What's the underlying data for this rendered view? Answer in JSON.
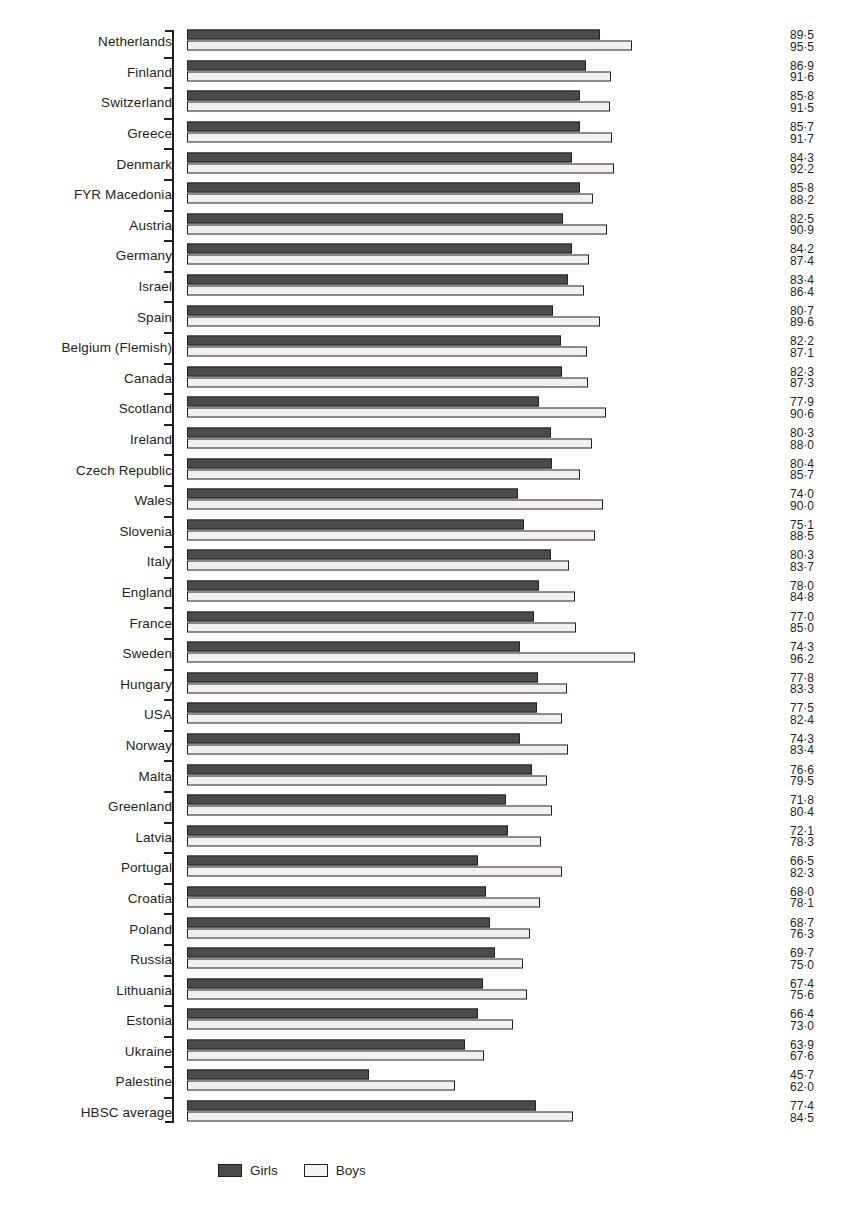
{
  "chart_data": {
    "type": "bar",
    "orientation": "horizontal",
    "title": "",
    "xlabel": "",
    "ylabel": "",
    "grid": false,
    "xlim": [
      0,
      100
    ],
    "value_suffix": "",
    "decimal_separator": "·",
    "legend": {
      "position": "bottom-left",
      "entries": [
        {
          "name": "Girls",
          "color": "#4d4a4b"
        },
        {
          "name": "Boys",
          "color": "#f5f4f2"
        }
      ]
    },
    "series": [
      {
        "name": "Girls",
        "color": "#4d4a4b"
      },
      {
        "name": "Boys",
        "color": "#f5f4f2"
      }
    ],
    "categories": [
      "Netherlands",
      "Finland",
      "Switzerland",
      "Greece",
      "Denmark",
      "FYR Macedonia",
      "Austria",
      "Germany",
      "Israel",
      "Spain",
      "Belgium (Flemish)",
      "Canada",
      "Scotland",
      "Ireland",
      "Czech Republic",
      "Wales",
      "Slovenia",
      "Italy",
      "England",
      "France",
      "Sweden",
      "Hungary",
      "USA",
      "Norway",
      "Malta",
      "Greenland",
      "Latvia",
      "Portugal",
      "Croatia",
      "Poland",
      "Russia",
      "Lithuania",
      "Estonia",
      "Ukraine",
      "Palestine",
      "HBSC average"
    ],
    "rows": [
      {
        "category": "Netherlands",
        "girls": 89.5,
        "boys": 95.5,
        "girls_label": "89·5",
        "boys_label": "95·5"
      },
      {
        "category": "Finland",
        "girls": 86.9,
        "boys": 91.6,
        "girls_label": "86·9",
        "boys_label": "91·6"
      },
      {
        "category": "Switzerland",
        "girls": 85.8,
        "boys": 91.5,
        "girls_label": "85·8",
        "boys_label": "91·5"
      },
      {
        "category": "Greece",
        "girls": 85.7,
        "boys": 91.7,
        "girls_label": "85·7",
        "boys_label": "91·7"
      },
      {
        "category": "Denmark",
        "girls": 84.3,
        "boys": 92.2,
        "girls_label": "84·3",
        "boys_label": "92·2"
      },
      {
        "category": "FYR Macedonia",
        "girls": 85.8,
        "boys": 88.2,
        "girls_label": "85·8",
        "boys_label": "88·2"
      },
      {
        "category": "Austria",
        "girls": 82.5,
        "boys": 90.9,
        "girls_label": "82·5",
        "boys_label": "90·9"
      },
      {
        "category": "Germany",
        "girls": 84.2,
        "boys": 87.4,
        "girls_label": "84·2",
        "boys_label": "87·4"
      },
      {
        "category": "Israel",
        "girls": 83.4,
        "boys": 86.4,
        "girls_label": "83·4",
        "boys_label": "86·4"
      },
      {
        "category": "Spain",
        "girls": 80.7,
        "boys": 89.6,
        "girls_label": "80·7",
        "boys_label": "89·6"
      },
      {
        "category": "Belgium (Flemish)",
        "girls": 82.2,
        "boys": 87.1,
        "girls_label": "82·2",
        "boys_label": "87·1"
      },
      {
        "category": "Canada",
        "girls": 82.3,
        "boys": 87.3,
        "girls_label": "82·3",
        "boys_label": "87·3"
      },
      {
        "category": "Scotland",
        "girls": 77.9,
        "boys": 90.6,
        "girls_label": "77·9",
        "boys_label": "90·6"
      },
      {
        "category": "Ireland",
        "girls": 80.3,
        "boys": 88.0,
        "girls_label": "80·3",
        "boys_label": "88·0"
      },
      {
        "category": "Czech Republic",
        "girls": 80.4,
        "boys": 85.7,
        "girls_label": "80·4",
        "boys_label": "85·7"
      },
      {
        "category": "Wales",
        "girls": 74.0,
        "boys": 90.0,
        "girls_label": "74·0",
        "boys_label": "90·0"
      },
      {
        "category": "Slovenia",
        "girls": 75.1,
        "boys": 88.5,
        "girls_label": "75·1",
        "boys_label": "88·5"
      },
      {
        "category": "Italy",
        "girls": 80.3,
        "boys": 83.7,
        "girls_label": "80·3",
        "boys_label": "83·7"
      },
      {
        "category": "England",
        "girls": 78.0,
        "boys": 84.8,
        "girls_label": "78·0",
        "boys_label": "84·8"
      },
      {
        "category": "France",
        "girls": 77.0,
        "boys": 85.0,
        "girls_label": "77·0",
        "boys_label": "85·0"
      },
      {
        "category": "Sweden",
        "girls": 74.3,
        "boys": 96.2,
        "girls_label": "74·3",
        "boys_label": "96·2"
      },
      {
        "category": "Hungary",
        "girls": 77.8,
        "boys": 83.3,
        "girls_label": "77·8",
        "boys_label": "83·3"
      },
      {
        "category": "USA",
        "girls": 77.5,
        "boys": 82.4,
        "girls_label": "77·5",
        "boys_label": "82·4"
      },
      {
        "category": "Norway",
        "girls": 74.3,
        "boys": 83.4,
        "girls_label": "74·3",
        "boys_label": "83·4"
      },
      {
        "category": "Malta",
        "girls": 76.6,
        "boys": 79.5,
        "girls_label": "76·6",
        "boys_label": "79·5"
      },
      {
        "category": "Greenland",
        "girls": 71.8,
        "boys": 80.4,
        "girls_label": "71·8",
        "boys_label": "80·4"
      },
      {
        "category": "Latvia",
        "girls": 72.1,
        "boys": 78.3,
        "girls_label": "72·1",
        "boys_label": "78·3"
      },
      {
        "category": "Portugal",
        "girls": 66.5,
        "boys": 82.3,
        "girls_label": "66·5",
        "boys_label": "82·3"
      },
      {
        "category": "Croatia",
        "girls": 68.0,
        "boys": 78.1,
        "girls_label": "68·0",
        "boys_label": "78·1"
      },
      {
        "category": "Poland",
        "girls": 68.7,
        "boys": 76.3,
        "girls_label": "68·7",
        "boys_label": "76·3"
      },
      {
        "category": "Russia",
        "girls": 69.7,
        "boys": 75.0,
        "girls_label": "69·7",
        "boys_label": "75·0"
      },
      {
        "category": "Lithuania",
        "girls": 67.4,
        "boys": 75.6,
        "girls_label": "67·4",
        "boys_label": "75·6"
      },
      {
        "category": "Estonia",
        "girls": 66.4,
        "boys": 73.0,
        "girls_label": "66·4",
        "boys_label": "73·0"
      },
      {
        "category": "Ukraine",
        "girls": 63.9,
        "boys": 67.6,
        "girls_label": "63·9",
        "boys_label": "67·6"
      },
      {
        "category": "Palestine",
        "girls": 45.7,
        "boys": 62.0,
        "girls_label": "45·7",
        "boys_label": "62·0"
      },
      {
        "category": "HBSC average",
        "girls": 77.4,
        "boys": 84.5,
        "girls_label": "77·4",
        "boys_label": "84·5"
      }
    ]
  },
  "scale": {
    "bar_origin_value": 11.3,
    "px_per_unit": 5.28,
    "bar_left_px": 187
  }
}
